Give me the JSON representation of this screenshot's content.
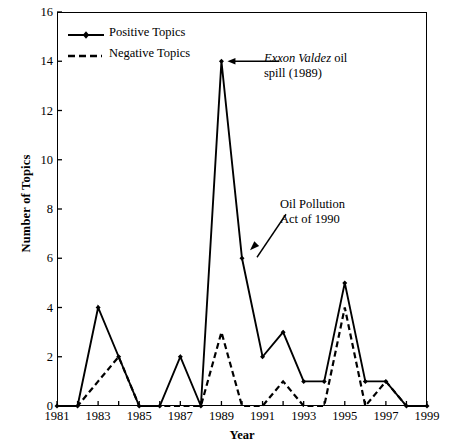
{
  "chart_data": {
    "type": "line",
    "title": "",
    "xlabel": "Year",
    "ylabel": "Number of Topics",
    "xlim": [
      1981,
      1999
    ],
    "ylim": [
      0,
      16
    ],
    "ytick_step": 2,
    "xtick_step": 2,
    "grid": false,
    "legend_position": "top-left",
    "x": [
      1981,
      1982,
      1983,
      1984,
      1985,
      1986,
      1987,
      1988,
      1989,
      1990,
      1991,
      1992,
      1993,
      1994,
      1995,
      1996,
      1997,
      1998,
      1999
    ],
    "xticks": [
      1981,
      1983,
      1985,
      1987,
      1989,
      1991,
      1993,
      1995,
      1997,
      1999
    ],
    "yticks": [
      0,
      2,
      4,
      6,
      8,
      10,
      12,
      14,
      16
    ],
    "series": [
      {
        "name": "Positive Topics",
        "style": "solid",
        "marker": "diamond",
        "values": [
          0,
          0,
          4,
          2,
          0,
          0,
          2,
          0,
          14,
          6,
          2,
          3,
          1,
          1,
          5,
          1,
          1,
          0,
          0
        ]
      },
      {
        "name": "Negative Topics",
        "style": "dashed",
        "marker": "none",
        "values": [
          0,
          0,
          1,
          2,
          0,
          0,
          0,
          0,
          3,
          0,
          0,
          1,
          0,
          0,
          4,
          0,
          1,
          0,
          0
        ]
      }
    ],
    "annotations": [
      {
        "id": "exxon",
        "text_italic": "Exxon Valdez",
        "text_rest": " oil",
        "text_line2": "spill (1989)",
        "points_to_year": 1989,
        "points_to_value": 14,
        "arrow": "horizontal-left"
      },
      {
        "id": "oil-pollution-act",
        "text_line1": "Oil Pollution",
        "text_line2": "Act of 1990",
        "points_to_year": 1990,
        "points_to_value": 6,
        "arrow": "diagonal-down-left"
      }
    ]
  },
  "legend": {
    "items": [
      {
        "label": "Positive Topics",
        "style": "solid",
        "color": "#000000"
      },
      {
        "label": "Negative Topics",
        "style": "dashed",
        "color": "#000000"
      }
    ]
  },
  "axes": {
    "x_title": "Year",
    "y_title": "Number of Topics",
    "x_tick_labels": [
      "1981",
      "1983",
      "1985",
      "1987",
      "1989",
      "1991",
      "1993",
      "1995",
      "1997",
      "1999"
    ],
    "y_tick_labels": [
      "0",
      "2",
      "4",
      "6",
      "8",
      "10",
      "12",
      "14",
      "16"
    ]
  },
  "annotations_text": {
    "exxon_italic": "Exxon Valdez",
    "exxon_rest": " oil",
    "exxon_line2": "spill (1989)",
    "opa_line1": "Oil Pollution",
    "opa_line2": "Act of 1990"
  },
  "colors": {
    "line": "#000000",
    "background": "#ffffff",
    "frame": "#000000"
  }
}
